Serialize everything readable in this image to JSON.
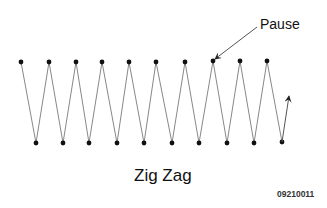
{
  "diagram": {
    "title": "Zig Zag",
    "figure_id": "09210011",
    "annotation": {
      "label": "Pause",
      "target_point_index": 15
    },
    "colors": {
      "line": "#888888",
      "dot": "#111111",
      "arrow": "#444444"
    },
    "points": [
      [
        21,
        62
      ],
      [
        36,
        143
      ],
      [
        49,
        62
      ],
      [
        63,
        143
      ],
      [
        76,
        62
      ],
      [
        89,
        143
      ],
      [
        102,
        62
      ],
      [
        117,
        143
      ],
      [
        129,
        62
      ],
      [
        144,
        143
      ],
      [
        156,
        62
      ],
      [
        172,
        143
      ],
      [
        185,
        62
      ],
      [
        199,
        143
      ],
      [
        213,
        61
      ],
      [
        227,
        143
      ],
      [
        240,
        61
      ],
      [
        254,
        143
      ],
      [
        267,
        61
      ],
      [
        282,
        142
      ]
    ],
    "end_arrow": {
      "from": [
        282,
        142
      ],
      "to": [
        289,
        96
      ]
    },
    "pause_arrow": {
      "from": [
        257,
        27
      ],
      "to": [
        215,
        59
      ]
    }
  }
}
